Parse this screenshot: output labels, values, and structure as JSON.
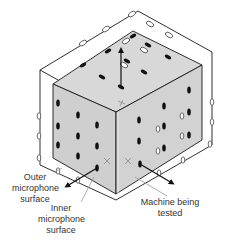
{
  "diagram": {
    "colors": {
      "machine_fill": "#d4d4d4",
      "edge": "#1a1a1a",
      "mic_inner": "#111111",
      "mic_outer_fill": "#ffffff",
      "leader": "#999999"
    },
    "labels": {
      "outer_surface": [
        "Outer",
        "microphone",
        "surface"
      ],
      "inner_surface": [
        "Inner",
        "microphone",
        "surface"
      ],
      "machine": [
        "Machine being",
        "tested"
      ]
    },
    "elements": {
      "outer_box": "outer microphone surface (wireframe)",
      "inner_box": "machine being tested (gray box)",
      "normal_arrows": [
        "top-normal",
        "left-normal",
        "right-normal"
      ],
      "cross_markers": 3
    }
  }
}
